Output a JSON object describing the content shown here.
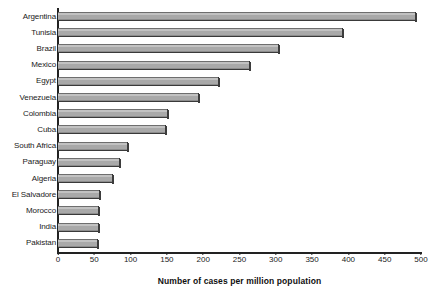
{
  "chart_data": {
    "type": "bar",
    "orientation": "horizontal",
    "title": "",
    "xlabel": "Number of cases per million population",
    "ylabel": "",
    "xlim": [
      0,
      500
    ],
    "xticks": [
      0,
      50,
      100,
      150,
      200,
      250,
      300,
      350,
      400,
      450,
      500
    ],
    "grid": false,
    "legend": null,
    "categories": [
      "Argentina",
      "Tunisia",
      "Brazil",
      "Mexico",
      "Egypt",
      "Venezuela",
      "Colombia",
      "Cuba",
      "South Africa",
      "Paraguay",
      "Algeria",
      "El Salvadore",
      "Morocco",
      "India",
      "Pakistan"
    ],
    "values": [
      493,
      393,
      304,
      264,
      222,
      194,
      151,
      149,
      96,
      85,
      76,
      58,
      56,
      56,
      55
    ],
    "bar_color": "#a9a9a9",
    "axis_color": "#222222"
  }
}
